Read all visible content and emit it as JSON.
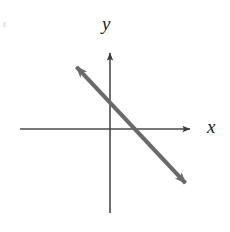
{
  "figure": {
    "background_color": "#ffffff",
    "width": 230,
    "height": 232
  },
  "axes": {
    "x_label": "x",
    "y_label": "y",
    "axis_color": "#4a4a4a",
    "axis_stroke_width": 1.6,
    "origin": {
      "x": 110,
      "y": 129
    },
    "x_axis": {
      "start_x": 20,
      "end_x": 196,
      "y": 129,
      "arrow": "right"
    },
    "y_axis": {
      "x": 110,
      "start_y": 213,
      "end_y": 47,
      "arrow": "up"
    }
  },
  "chart_data": {
    "type": "line",
    "title": "",
    "xlabel": "x",
    "ylabel": "y",
    "grid": false,
    "legend": null,
    "axis_ticks": {
      "x": [],
      "y": []
    },
    "series": [
      {
        "name": "line",
        "style": "double-headed-arrow",
        "color": "#6a6a6a",
        "stroke_width": 4.2,
        "slope": -1.07,
        "y_intercept_px": 101,
        "x_intercept_px": 133,
        "endpoints_px": [
          {
            "x": 70,
            "y": 60
          },
          {
            "x": 192,
            "y": 190
          }
        ],
        "direction": "decreasing",
        "quadrants_crossed": [
          2,
          1,
          4
        ]
      }
    ],
    "ylim": [
      0,
      232
    ],
    "xlim": [
      0,
      230
    ]
  },
  "colors": {
    "line": "#6a6a6a",
    "axis": "#4a4a4a",
    "label": "#1c1c1c",
    "background": "#ffffff"
  }
}
